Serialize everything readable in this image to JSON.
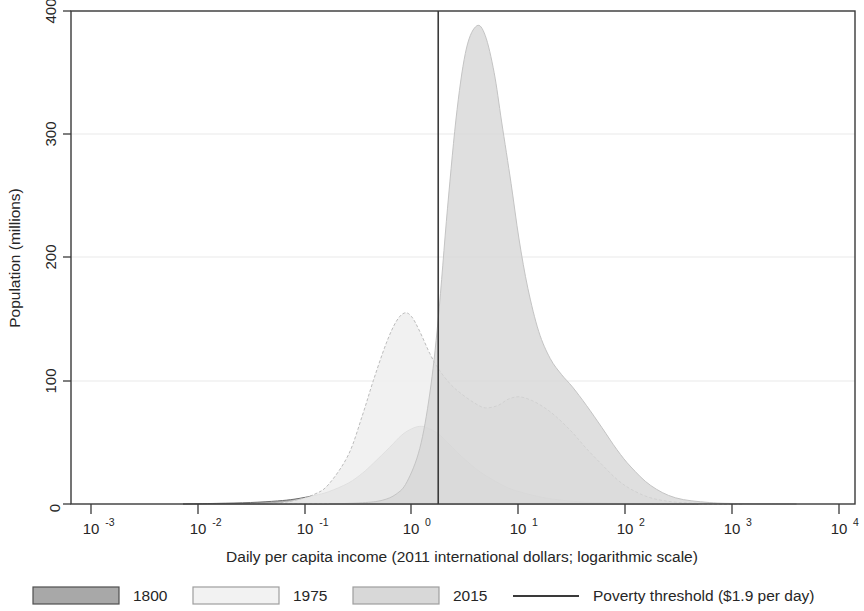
{
  "chart_data": {
    "type": "area",
    "title": "",
    "xlabel": "Daily per capita income (2011 international dollars; logarithmic scale)",
    "ylabel": "Population (millions)",
    "xscale": "log",
    "xlim": [
      0.001,
      10000
    ],
    "ylim": [
      0,
      400
    ],
    "grid": true,
    "grid_axis": "y",
    "legend_position": "bottom",
    "xtick_labels": [
      "10-3",
      "10-2",
      "10-1",
      "100",
      "101",
      "102",
      "103",
      "104"
    ],
    "xtick_bases": [
      "10",
      "10",
      "10",
      "10",
      "10",
      "10",
      "10",
      "10"
    ],
    "xtick_exponents": [
      "-3",
      "-2",
      "-1",
      "0",
      "1",
      "2",
      "3",
      "4"
    ],
    "xtick_values": [
      0.001,
      0.01,
      0.1,
      1,
      10,
      100,
      1000,
      10000
    ],
    "ytick_labels": [
      "0",
      "100",
      "200",
      "300",
      "400"
    ],
    "ytick_values": [
      0,
      100,
      200,
      300,
      400
    ],
    "annotations": [
      {
        "name": "poverty-threshold-line",
        "type": "vline",
        "x": 1.9,
        "label": "Poverty threshold ($1.9 per day)",
        "color": "#3a3a3a"
      }
    ],
    "series": [
      {
        "name": "1800",
        "color": "#a8a8a8",
        "edge_color": "#6e6e6e",
        "x": [
          0.01,
          0.02,
          0.04,
          0.07,
          0.1,
          0.15,
          0.2,
          0.3,
          0.4,
          0.5,
          0.7,
          0.9,
          1.1,
          1.3,
          1.5,
          1.9,
          2.3,
          2.8,
          3.5,
          4.5,
          6,
          8,
          11,
          15,
          20,
          30,
          45,
          70,
          100,
          200,
          400
        ],
        "values": [
          0,
          0.5,
          1.2,
          2.5,
          4,
          7,
          10,
          17,
          25,
          33,
          46,
          56,
          61,
          63,
          62,
          57,
          50,
          42,
          34,
          26,
          19,
          13,
          9,
          6,
          4,
          2.2,
          1.2,
          0.6,
          0.3,
          0.1,
          0
        ]
      },
      {
        "name": "1975",
        "color": "#ececec",
        "edge_color": "#b6b6b6",
        "x": [
          0.04,
          0.07,
          0.1,
          0.15,
          0.2,
          0.3,
          0.4,
          0.5,
          0.65,
          0.8,
          0.95,
          1.1,
          1.3,
          1.6,
          1.9,
          2.4,
          3,
          4,
          5,
          6.5,
          8,
          10,
          13,
          17,
          22,
          30,
          40,
          55,
          75,
          100,
          150,
          250,
          500,
          1000
        ],
        "values": [
          0,
          1,
          3,
          8,
          16,
          40,
          72,
          100,
          130,
          148,
          155,
          152,
          140,
          122,
          110,
          98,
          90,
          82,
          78,
          80,
          85,
          87,
          84,
          78,
          70,
          58,
          45,
          32,
          20,
          12,
          5,
          1.5,
          0.3,
          0
        ]
      },
      {
        "name": "2015",
        "color": "#d8d8d8",
        "edge_color": "#bfbfbf",
        "x": [
          0.2,
          0.4,
          0.6,
          0.8,
          1.0,
          1.3,
          1.6,
          1.9,
          2.3,
          2.8,
          3.4,
          4.2,
          5,
          6,
          7,
          8.5,
          10,
          12,
          15,
          19,
          24,
          30,
          40,
          55,
          75,
          100,
          150,
          250,
          500,
          1000,
          3000
        ],
        "values": [
          0,
          1,
          3,
          8,
          18,
          45,
          90,
          150,
          240,
          320,
          370,
          388,
          380,
          350,
          310,
          260,
          215,
          175,
          140,
          118,
          105,
          95,
          80,
          62,
          44,
          30,
          15,
          5,
          1.2,
          0.3,
          0
        ]
      }
    ],
    "legend": [
      {
        "label": "1800",
        "swatch": "#a8a8a8",
        "border": "#6e6e6e",
        "kind": "patch"
      },
      {
        "label": "1975",
        "swatch": "#f2f2f2",
        "border": "#b6b6b6",
        "kind": "patch"
      },
      {
        "label": "2015",
        "swatch": "#d8d8d8",
        "border": "#bfbfbf",
        "kind": "patch"
      },
      {
        "label": "Poverty threshold ($1.9 per day)",
        "swatch": "#3a3a3a",
        "border": "#3a3a3a",
        "kind": "line"
      }
    ]
  }
}
